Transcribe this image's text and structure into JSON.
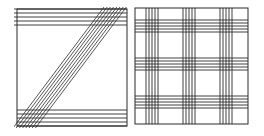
{
  "figure": {
    "width": 264,
    "height": 136,
    "stroke_color": "#2a2a2a",
    "background": "#ffffff",
    "panels": [
      {
        "id": "left",
        "description": "Square frame with horizontal line bands at top and bottom and a diagonal band of parallel lines from lower-left to upper-right",
        "frame": {
          "x": 17,
          "y": 9,
          "w": 110,
          "h": 117
        },
        "top_band_y": [
          9,
          13,
          17,
          21,
          25
        ],
        "bottom_band_y": [
          110,
          114,
          118,
          122,
          126
        ],
        "diagonal_lines": 8,
        "diagonal_spacing": 3.2
      },
      {
        "id": "right",
        "description": "Square frame with three vertical and three horizontal bands of parallel lines forming a plaid grid",
        "frame": {
          "x": 135,
          "y": 8,
          "w": 113,
          "h": 116
        },
        "vertical_band_starts": [
          146,
          183,
          220
        ],
        "horizontal_band_starts": [
          20,
          58,
          96
        ],
        "lines_per_band": 5,
        "line_spacing": 3
      }
    ]
  }
}
